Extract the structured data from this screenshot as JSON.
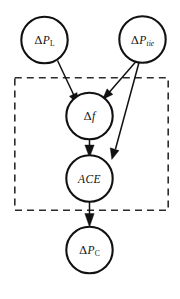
{
  "figure": {
    "type": "causal-graphical-model-diagram",
    "background_color": "#ffffff",
    "stroke_color": "#111111",
    "plate_color": "#2b2b2b",
    "width": 180,
    "height": 299
  },
  "nodes": {
    "load_disturbance": {
      "id": "delta-p-l",
      "symbol": "Δ",
      "base": "P",
      "subscript": "L",
      "label": "ΔP_L",
      "cx": 44.5,
      "cy": 40,
      "r": 23.5
    },
    "tie_line_power": {
      "id": "delta-p-tie",
      "symbol": "Δ",
      "base": "P",
      "subscript": "tie",
      "label": "ΔP_tie",
      "cx": 142.5,
      "cy": 39.5,
      "r": 23.5
    },
    "frequency_deviation": {
      "id": "delta-f",
      "symbol": "Δ",
      "base": "f",
      "subscript": "",
      "label": "Δf",
      "cx": 89.5,
      "cy": 116,
      "r": 23.5
    },
    "area_control_error": {
      "id": "ace",
      "symbol": "",
      "base": "ACE",
      "subscript": "",
      "label": "ACE",
      "cx": 89.5,
      "cy": 178.5,
      "r": 23.5
    },
    "control_power": {
      "id": "delta-p-c",
      "symbol": "Δ",
      "base": "P",
      "subscript": "C",
      "label": "ΔP_C",
      "cx": 89.5,
      "cy": 250,
      "r": 23.5
    }
  },
  "edges": [
    {
      "id": "edge-dpl-to-df",
      "from": "ΔP_L",
      "to": "Δf",
      "style": "solid-arrow"
    },
    {
      "id": "edge-dptie-to-df",
      "from": "ΔP_tie",
      "to": "Δf",
      "style": "solid-arrow"
    },
    {
      "id": "edge-dptie-to-ace",
      "from": "ΔP_tie",
      "to": "ACE",
      "style": "solid-arrow"
    },
    {
      "id": "edge-df-to-ace",
      "from": "Δf",
      "to": "ACE",
      "style": "solid-arrow"
    },
    {
      "id": "edge-ace-to-dpc",
      "from": "ACE",
      "to": "ΔP_C",
      "style": "solid-arrow"
    }
  ],
  "plate": {
    "id": "dashed-plate",
    "x": 14,
    "y": 77,
    "width": 155,
    "height": 134,
    "dashed": true
  }
}
